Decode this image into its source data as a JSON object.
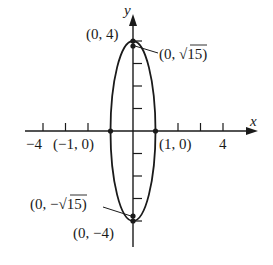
{
  "diagram": {
    "type": "ellipse-graph",
    "axes": {
      "x_label": "x",
      "y_label": "y",
      "x_tick_labels": [
        {
          "value": -4,
          "text": "−4"
        },
        {
          "value": 4,
          "text": "4"
        }
      ],
      "x_range": [
        -4.8,
        5.5
      ],
      "y_range": [
        -5.1,
        5.2
      ],
      "ticks": [
        -4,
        -3,
        -2,
        -1,
        1,
        2,
        3,
        4
      ]
    },
    "ellipse": {
      "center": [
        0,
        0
      ],
      "semi_axis_x": 1,
      "semi_axis_y": 4
    },
    "points": [
      {
        "id": "vertex-top",
        "coords": [
          0,
          4
        ],
        "label": "(0, 4)"
      },
      {
        "id": "vertex-bottom",
        "coords": [
          0,
          -4
        ],
        "label": "(0, −4)"
      },
      {
        "id": "focus-top",
        "coords": [
          0,
          3.873
        ],
        "label_prefix": "(0, ",
        "label_radicand": "15",
        "label_suffix": ")"
      },
      {
        "id": "focus-bottom",
        "coords": [
          0,
          -3.873
        ],
        "label_prefix": "(0, −",
        "label_radicand": "15",
        "label_suffix": ")"
      },
      {
        "id": "covertex-left",
        "coords": [
          -1,
          0
        ],
        "label": "(−1, 0)"
      },
      {
        "id": "covertex-right",
        "coords": [
          1,
          0
        ],
        "label": "(1, 0)"
      }
    ],
    "colors": {
      "stroke": "#1a1a1a",
      "background": "#ffffff"
    }
  }
}
